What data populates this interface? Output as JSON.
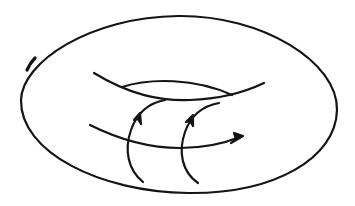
{
  "figure": {
    "stroke_color": "#141414",
    "background": "#ffffff",
    "stroke_width": 2.2,
    "curves": {
      "outer_boundary": {
        "label": "torus outline"
      },
      "hole_upper": {
        "label": "inner hole upper edge"
      },
      "hole_lower": {
        "label": "inner hole lower edge"
      },
      "longitude": {
        "label": "longitudinal loop with arrow"
      },
      "meridian_1": {
        "label": "meridian loop 1 with arrow"
      },
      "meridian_2": {
        "label": "meridian loop 2 with arrow"
      }
    }
  }
}
